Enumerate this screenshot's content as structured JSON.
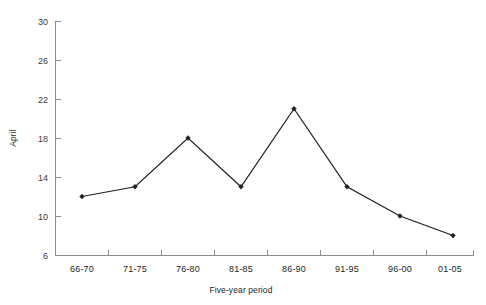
{
  "chart_data": {
    "type": "line",
    "title": "",
    "xlabel": "Five-year period",
    "ylabel": "April",
    "categories": [
      "66-70",
      "71-75",
      "76-80",
      "81-85",
      "86-90",
      "91-95",
      "96-00",
      "01-05"
    ],
    "values": [
      12,
      13,
      18,
      13,
      21,
      13,
      10,
      8
    ],
    "series": [
      {
        "name": "April",
        "values": [
          12,
          13,
          18,
          13,
          21,
          13,
          10,
          8
        ]
      }
    ],
    "ylim": [
      6,
      30
    ],
    "ytick_step": 4,
    "ytick_labels": [
      "6",
      "10",
      "14",
      "18",
      "22",
      "26",
      "30"
    ],
    "ytick_values": [
      6,
      10,
      14,
      18,
      22,
      26,
      30
    ],
    "grid": false,
    "legend": false,
    "legend_position": "none",
    "marker": "diamond",
    "line_color": "#231f20",
    "marker_color": "#231f20",
    "axis_color": "#8c8c8c",
    "background_color": "#ffffff"
  },
  "axes": {
    "y_title": "April",
    "x_title": "Five-year period"
  }
}
